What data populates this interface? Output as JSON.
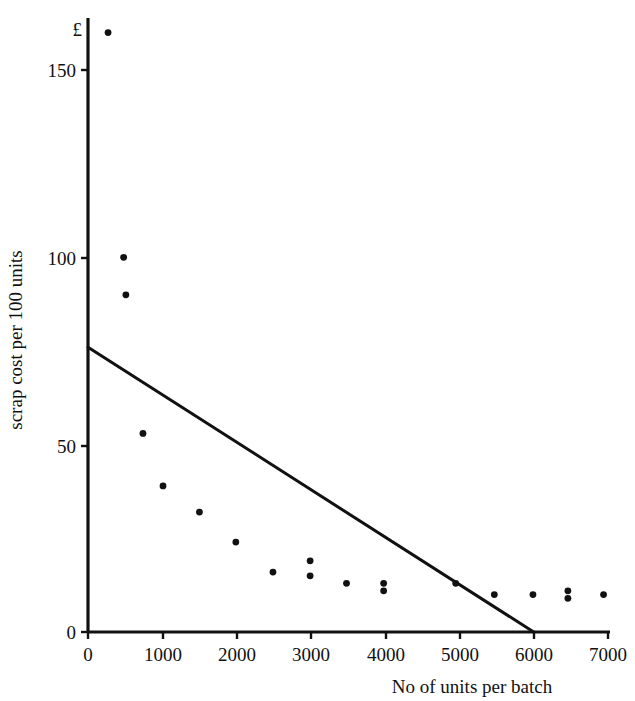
{
  "chart_data": {
    "type": "scatter",
    "title": "",
    "xlabel": "No of units per batch",
    "ylabel": "scrap cost per 100 units",
    "y_unit_symbol": "£",
    "xlim": [
      0,
      7000
    ],
    "ylim": [
      0,
      163
    ],
    "grid": false,
    "legend": "none",
    "x_ticks": [
      0,
      1000,
      2000,
      3000,
      4000,
      5000,
      6000,
      7000
    ],
    "x_tick_labels": [
      "0",
      "1000",
      "2000",
      "3000",
      "4000",
      "5000",
      "6000",
      "7000"
    ],
    "y_ticks": [
      0,
      50,
      100,
      150
    ],
    "y_tick_labels": [
      "0",
      "50",
      "100",
      "150"
    ],
    "points": [
      {
        "x": 270,
        "y": 160
      },
      {
        "x": 480,
        "y": 100
      },
      {
        "x": 510,
        "y": 90
      },
      {
        "x": 740,
        "y": 53
      },
      {
        "x": 1010,
        "y": 39
      },
      {
        "x": 1500,
        "y": 32
      },
      {
        "x": 1990,
        "y": 24
      },
      {
        "x": 2490,
        "y": 16
      },
      {
        "x": 2990,
        "y": 19
      },
      {
        "x": 2990,
        "y": 15
      },
      {
        "x": 3480,
        "y": 13
      },
      {
        "x": 3980,
        "y": 13
      },
      {
        "x": 3980,
        "y": 11
      },
      {
        "x": 4950,
        "y": 13
      },
      {
        "x": 5470,
        "y": 10
      },
      {
        "x": 5990,
        "y": 10
      },
      {
        "x": 6460,
        "y": 11
      },
      {
        "x": 6460,
        "y": 9
      },
      {
        "x": 6940,
        "y": 10
      }
    ],
    "trend_line": {
      "label": "fitted line",
      "x_start": 0,
      "y_start": 76,
      "x_end": 6000,
      "y_end": 0
    },
    "series_name": "scrap cost observations",
    "point_color": "#111111",
    "line_color": "#111111",
    "axis_color": "#111111",
    "background_color": "#ffffff"
  }
}
